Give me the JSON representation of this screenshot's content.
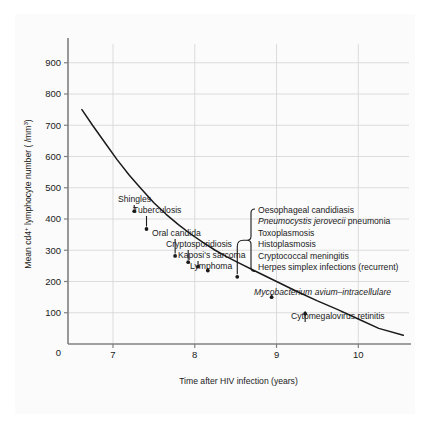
{
  "chart_data": {
    "type": "line",
    "title": "",
    "xlabel": "Time after HIV infection (years)",
    "ylabel": "Mean cd4+ lymphocyte number ( /mm3)",
    "ylabel_parts": {
      "prefix": "Mean cd4",
      "superscript": "+",
      "middle": " lymphocyte number ( /mm",
      "superscript2": "3",
      "suffix": ")"
    },
    "xlim": [
      6.45,
      10.62
    ],
    "ylim": [
      0,
      960
    ],
    "xticks": [
      7,
      8,
      9,
      10
    ],
    "xtick_labels": [
      "7",
      "8",
      "9",
      "10"
    ],
    "yticks": [
      100,
      200,
      300,
      400,
      500,
      600,
      700,
      800,
      900
    ],
    "ytick_labels": [
      "100",
      "200",
      "300",
      "400",
      "500",
      "600",
      "700",
      "800",
      "900"
    ],
    "origin_label": "0",
    "grid": true,
    "legend": "none",
    "series": [
      {
        "name": "Mean CD4 lymphocyte decline",
        "x": [
          6.62,
          6.75,
          6.9,
          7.05,
          7.2,
          7.35,
          7.5,
          7.65,
          7.8,
          7.95,
          8.1,
          8.25,
          8.4,
          8.55,
          8.75,
          9.0,
          9.25,
          9.5,
          9.75,
          10.0,
          10.25,
          10.55
        ],
        "y": [
          750,
          700,
          645,
          590,
          540,
          495,
          452,
          415,
          382,
          352,
          325,
          300,
          278,
          258,
          232,
          200,
          168,
          138,
          110,
          80,
          50,
          28
        ]
      }
    ],
    "annotations": [
      {
        "label": "Shingles",
        "italic": false,
        "x_point": 7.26,
        "y_point": 425
      },
      {
        "label": "Tuberculosis",
        "italic": false,
        "x_point": 7.41,
        "y_point": 368
      },
      {
        "label": "Oral candida",
        "italic": false,
        "x_point": 7.76,
        "y_point": 282
      },
      {
        "label": "Cryptosporidiosis",
        "italic": false,
        "x_point": 7.92,
        "y_point": 262
      },
      {
        "label": "Kaposi's sarcoma",
        "italic": false,
        "x_point": 8.04,
        "y_point": 248
      },
      {
        "label": "Lymphoma",
        "italic": false,
        "x_point": 8.16,
        "y_point": 235
      },
      {
        "label": "Mycobacterium avium–intracellulare",
        "italic": true,
        "x_point": 8.94,
        "y_point": 150
      },
      {
        "label": "Cytomegalovirus retinitis",
        "italic": false,
        "x_point": 9.35,
        "y_point": 97
      }
    ],
    "bracket_group": {
      "x_point": 8.52,
      "y_point": 215,
      "items": [
        {
          "label": "Oesophageal candidiasis",
          "italic": false
        },
        {
          "label": "Pneumocystis jerovecii pneumonia",
          "italic": true,
          "italic_part": "Pneumocystis jerovecii",
          "roman_part": " pneumonia"
        },
        {
          "label": "Toxoplasmosis",
          "italic": false
        },
        {
          "label": "Histoplasmosis",
          "italic": false
        },
        {
          "label": "Cryptococcal meningitis",
          "italic": false
        },
        {
          "label": "Herpes simplex infections (recurrent)",
          "italic": false
        }
      ]
    },
    "colors": {
      "curve": "#1a1a1a",
      "grid": "#d8d8d8",
      "axis": "#808080",
      "text": "#1a1a1a",
      "panel_background": "#fbfbfb"
    }
  }
}
